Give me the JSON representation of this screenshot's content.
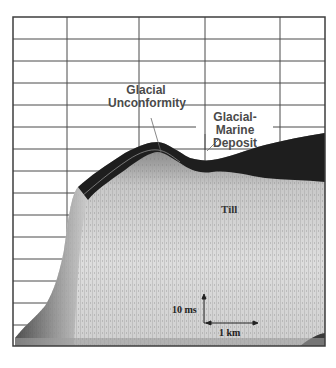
{
  "figure": {
    "type": "seismic-reflection-profile",
    "colors": {
      "background": "#ffffff",
      "grid": "#4a4a4a",
      "seafloor_band": "#1e1e1e",
      "sediment_fill": "#d8d8d8"
    },
    "grid": {
      "vertical_lines_x": [
        67,
        139,
        205,
        280
      ],
      "horizontal_lines_y": [
        39,
        61,
        83,
        105,
        127,
        149,
        171,
        193,
        215,
        237,
        259,
        281,
        303,
        325
      ]
    }
  },
  "annotations": {
    "glacial_unconformity": {
      "line1": "Glacial",
      "line2": "Unconformity"
    },
    "glacial_marine_deposit": {
      "line1": "Glacial-Marine",
      "line2": "Deposit"
    },
    "till": "Till"
  },
  "scale": {
    "vertical": "10 ms",
    "horizontal": "1 km"
  }
}
